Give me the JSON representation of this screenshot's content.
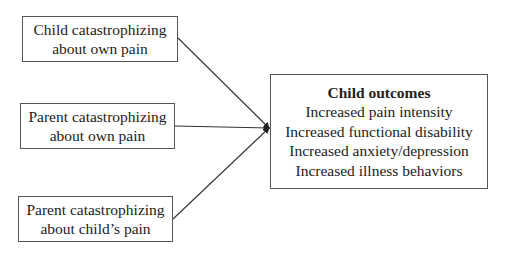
{
  "inputs": [
    {
      "line1": "Child catastrophizing",
      "line2": "about own pain"
    },
    {
      "line1": "Parent catastrophizing",
      "line2": "about own pain"
    },
    {
      "line1": "Parent catastrophizing",
      "line2": "about child’s pain"
    }
  ],
  "outcome": {
    "title": "Child outcomes",
    "items": [
      "Increased pain intensity",
      "Increased functional disability",
      "Increased anxiety/depression",
      "Increased illness behaviors"
    ]
  }
}
